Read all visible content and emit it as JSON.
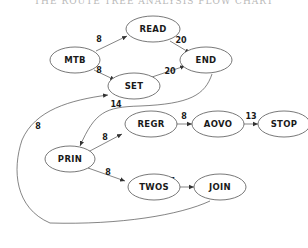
{
  "caption": "THE ROUTE TREE ANALYSIS FLOW CHART",
  "nodes": {
    "read": "READ",
    "mtb": "MTB",
    "end": "END",
    "set": "SET",
    "regr": "REGR",
    "aovo": "AOVO",
    "stop": "STOP",
    "prin": "PRIN",
    "twos": "TWOS",
    "join": "JOIN"
  },
  "edges": {
    "mtb_read": "8",
    "read_end": "20",
    "mtb_set": "8",
    "set_end": "20",
    "join_set": "14",
    "join_loop": "8",
    "prin_regr": "8",
    "regr_aovo": "8",
    "aovo_stop": "13",
    "prin_twos": "8",
    "twos_join": "7"
  },
  "colors": {
    "stroke": "#333333",
    "text": "#1a1a1a",
    "background": "#ffffff"
  }
}
